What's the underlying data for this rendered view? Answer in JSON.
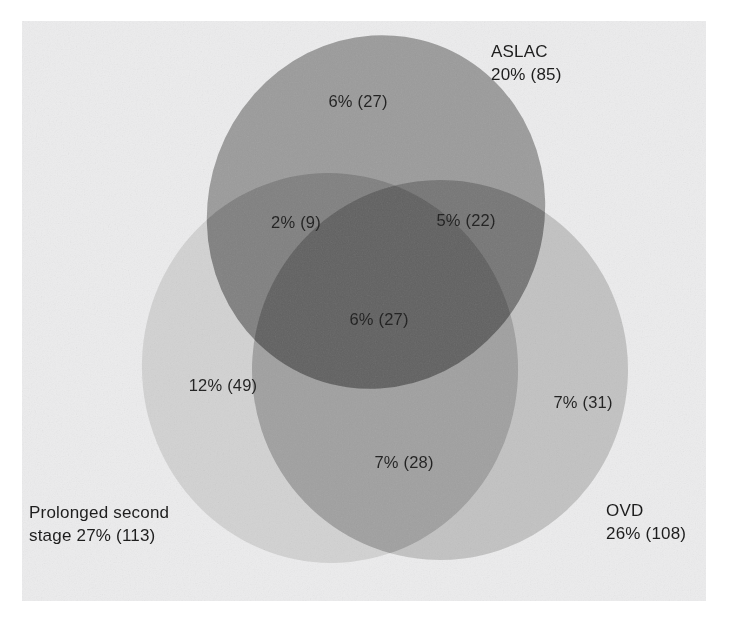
{
  "figure": {
    "kind": "venn-diagram-3-set",
    "background_color": "#ffffff",
    "canvas_color": "#ececed",
    "text_color": "#1b1b1b"
  },
  "chart_data": {
    "type": "pie",
    "diagram_type": "venn",
    "title": "",
    "subtitle": "",
    "xlabel": "",
    "ylabel": "",
    "sets": [
      {
        "id": "aslac",
        "name": "ASLAC",
        "total_label": "20% (85)",
        "percent": 20,
        "count": 85,
        "fill": "#9b9b9b",
        "title_line1": "ASLAC",
        "title_line2": "20% (85)"
      },
      {
        "id": "prolonged_second_stage",
        "name": "Prolonged second stage",
        "total_label": "27% (113)",
        "percent": 27,
        "count": 113,
        "fill": "#d2d2d2",
        "title_line1": "Prolonged second",
        "title_line2": "stage 27% (113)"
      },
      {
        "id": "ovd",
        "name": "OVD",
        "total_label": "26% (108)",
        "percent": 26,
        "count": 108,
        "fill": "#c2c2c2",
        "title_line1": "OVD",
        "title_line2": "26% (108)"
      }
    ],
    "regions": [
      {
        "id": "aslac-only",
        "members": [
          "ASLAC"
        ],
        "label": "6% (27)",
        "percent": 6,
        "count": 27,
        "x": 358,
        "y": 103
      },
      {
        "id": "aslac-prolonged",
        "members": [
          "ASLAC",
          "Prolonged second stage"
        ],
        "label": "2% (9)",
        "percent": 2,
        "count": 9,
        "x": 296,
        "y": 224
      },
      {
        "id": "aslac-ovd",
        "members": [
          "ASLAC",
          "OVD"
        ],
        "label": "5% (22)",
        "percent": 5,
        "count": 22,
        "x": 466,
        "y": 222
      },
      {
        "id": "aslac-prolonged-ovd",
        "members": [
          "ASLAC",
          "Prolonged second stage",
          "OVD"
        ],
        "label": "6% (27)",
        "percent": 6,
        "count": 27,
        "x": 379,
        "y": 321
      },
      {
        "id": "prolonged-only",
        "members": [
          "Prolonged second stage"
        ],
        "label": "12% (49)",
        "percent": 12,
        "count": 49,
        "x": 223,
        "y": 387
      },
      {
        "id": "ovd-only",
        "members": [
          "OVD"
        ],
        "label": "7% (31)",
        "percent": 7,
        "count": 31,
        "x": 583,
        "y": 404
      },
      {
        "id": "prolonged-ovd",
        "members": [
          "Prolonged second stage",
          "OVD"
        ],
        "label": "7% (28)",
        "percent": 7,
        "count": 28,
        "x": 404,
        "y": 464
      }
    ],
    "set_titles": [
      {
        "id": "aslac-title",
        "line1": "ASLAC",
        "line2": "20% (85)",
        "x": 491,
        "y": 57
      },
      {
        "id": "prolonged-title",
        "line1": "Prolonged second",
        "line2": "stage 27% (113)",
        "x": 29,
        "y": 518
      },
      {
        "id": "ovd-title",
        "line1": "OVD",
        "line2": "26% (108)",
        "x": 606,
        "y": 516
      }
    ],
    "legend_position": "in-figure",
    "grid": false
  }
}
